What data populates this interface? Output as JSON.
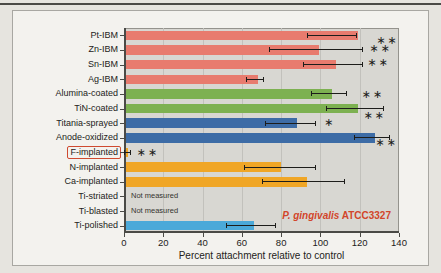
{
  "chart_data": {
    "type": "bar",
    "orientation": "horizontal",
    "xlabel": "Percent attachment relative to control",
    "xlim": [
      0,
      140
    ],
    "xticks": [
      0,
      20,
      40,
      60,
      80,
      100,
      120,
      140
    ],
    "grid": "vertical",
    "plot_bg_color": "#d8d7d2",
    "not_measured_label": "Not measured",
    "annotation": {
      "species": "P. gingivalis",
      "strain": " ATCC3327",
      "color": "#d2452a"
    },
    "palette": {
      "ibm": "#e87b6e",
      "coated": "#7db151",
      "oxidized": "#3d6ca6",
      "implanted": "#f0a626",
      "polished": "#4ba9d9"
    },
    "rows": [
      {
        "label": "Pt-IBM",
        "value": 118,
        "err_low": 93,
        "err_high": 118,
        "color": "#e87b6e",
        "sig": "**",
        "sig_x": 128.5,
        "sig_dy": 5
      },
      {
        "label": "Zn-IBM",
        "value": 98,
        "err_low": 74,
        "err_high": 121,
        "color": "#e87b6e",
        "sig": "**",
        "sig_x": 125,
        "sig_dy": -2
      },
      {
        "label": "Sn-IBM",
        "value": 107,
        "err_low": 91,
        "err_high": 121,
        "color": "#e87b6e",
        "sig": "**",
        "sig_x": 124,
        "sig_dy": -3
      },
      {
        "label": "Ag-IBM",
        "value": 67,
        "err_low": 62,
        "err_high": 71,
        "color": "#e87b6e",
        "sig": "",
        "sig_x": null,
        "sig_dy": 0
      },
      {
        "label": "Alumina-coated",
        "value": 105,
        "err_low": 95,
        "err_high": 113,
        "color": "#7db151",
        "sig": "**",
        "sig_x": 121,
        "sig_dy": 0
      },
      {
        "label": "TiN-coated",
        "value": 118,
        "err_low": 103,
        "err_high": 132,
        "color": "#7db151",
        "sig": "**",
        "sig_x": 122,
        "sig_dy": 6
      },
      {
        "label": "Titania-sprayed",
        "value": 87,
        "err_low": 72,
        "err_high": 97,
        "color": "#3d6ca6",
        "sig": "*",
        "sig_x": 102,
        "sig_dy": -1
      },
      {
        "label": "Anode-oxidized",
        "value": 127,
        "err_low": 117,
        "err_high": 135,
        "color": "#3d6ca6",
        "sig": "**",
        "sig_x": 128,
        "sig_dy": 4
      },
      {
        "label": "F-implanted",
        "value": 1,
        "err_low": 0,
        "err_high": 3,
        "color": "#f0a626",
        "sig": "**",
        "sig_x": 6.5,
        "sig_dy": 0,
        "boxed": true
      },
      {
        "label": "N-implanted",
        "value": 79,
        "err_low": 61,
        "err_high": 97,
        "color": "#f0a626",
        "sig": "",
        "sig_x": null,
        "sig_dy": 0
      },
      {
        "label": "Ca-implanted",
        "value": 92,
        "err_low": 70,
        "err_high": 112,
        "color": "#f0a626",
        "sig": "",
        "sig_x": null,
        "sig_dy": 0
      },
      {
        "label": "Ti-striated",
        "value": null,
        "note": "Not measured"
      },
      {
        "label": "Ti-blasted",
        "value": null,
        "note": "Not measured"
      },
      {
        "label": "Ti-polished",
        "value": 65,
        "err_low": 52,
        "err_high": 77,
        "color": "#4ba9d9",
        "sig": "",
        "sig_x": null,
        "sig_dy": 0
      }
    ]
  }
}
